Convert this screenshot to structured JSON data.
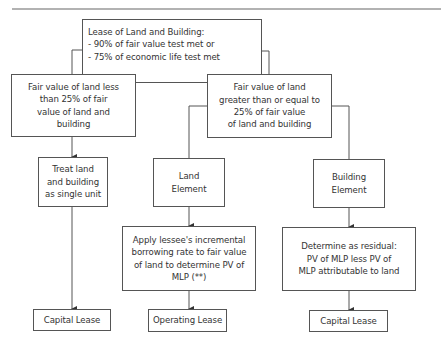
{
  "diagram": {
    "title_rule": true,
    "root": {
      "lines": [
        "Lease of Land and Building:",
        "- 90% of fair value test met or",
        "- 75% of economic life test met"
      ]
    },
    "branch_less": {
      "lines": [
        "Fair value of land less",
        "than 25% of fair",
        "value of land and",
        "building"
      ]
    },
    "branch_greater": {
      "lines": [
        "Fair value of land",
        "greater than or equal to",
        "25% of fair value",
        "of land and building"
      ]
    },
    "single_unit": {
      "lines": [
        "Treat land",
        "and building",
        "as single unit"
      ]
    },
    "land_element": {
      "lines": [
        "Land",
        "Element"
      ]
    },
    "building_element": {
      "lines": [
        "Building",
        "Element"
      ]
    },
    "land_method": {
      "lines": [
        "Apply lessee's incremental",
        "borrowing rate to fair value",
        "of land to determine PV of",
        "MLP (**)"
      ]
    },
    "building_method": {
      "lines": [
        "Determine as residual:",
        "PV of MLP less PV of",
        "MLP attributable to land"
      ]
    },
    "outcomes": {
      "single_unit": "Capital Lease",
      "land": "Operating Lease",
      "building": "Capital Lease"
    },
    "colors": {
      "line": "#555555",
      "text": "#333333",
      "background": "#ffffff"
    }
  }
}
